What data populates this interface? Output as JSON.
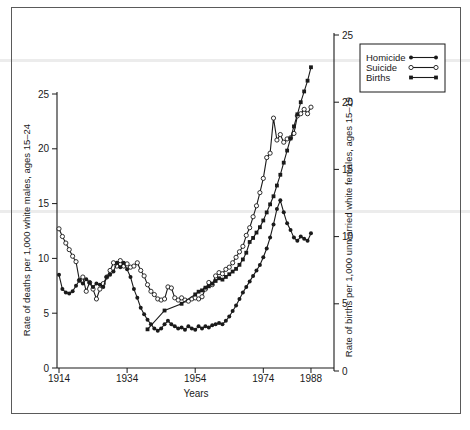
{
  "figure": {
    "background": "#ffffff",
    "frame_color": "#5a5a5a",
    "ink_color": "#1a1a1a",
    "artifact_band_color": "#ececec"
  },
  "chart_data": {
    "type": "line",
    "title": "",
    "xlabel": "Years",
    "ylabel_left": "Rate of deaths per 1,000 white males, ages 15–24",
    "ylabel_right": "Rate of births per 1,000 unmarried white females, ages 15–19",
    "x_ticks": [
      1914,
      1934,
      1954,
      1974,
      1988
    ],
    "x_range": [
      1914,
      1995
    ],
    "y_left_ticks": [
      0,
      5,
      10,
      15,
      20,
      25
    ],
    "y_left_range": [
      0,
      25
    ],
    "y_right_ticks": [
      0,
      5,
      10,
      15,
      20,
      25
    ],
    "y_right_range": [
      0,
      25
    ],
    "grid": false,
    "legend_position": "top-right",
    "series": [
      {
        "name": "Homicide",
        "axis": "left",
        "marker": "filled-circle",
        "color": "#1a1a1a",
        "x": [
          1914,
          1915,
          1916,
          1917,
          1918,
          1919,
          1920,
          1921,
          1922,
          1923,
          1924,
          1925,
          1926,
          1927,
          1928,
          1929,
          1930,
          1931,
          1932,
          1933,
          1934,
          1935,
          1936,
          1937,
          1938,
          1939,
          1940,
          1941,
          1942,
          1943,
          1944,
          1945,
          1946,
          1947,
          1948,
          1949,
          1950,
          1951,
          1952,
          1953,
          1954,
          1955,
          1956,
          1957,
          1958,
          1959,
          1960,
          1961,
          1962,
          1963,
          1964,
          1965,
          1966,
          1967,
          1968,
          1969,
          1970,
          1971,
          1972,
          1973,
          1974,
          1975,
          1976,
          1977,
          1978,
          1979,
          1980,
          1981,
          1982,
          1983,
          1984,
          1985,
          1986,
          1987,
          1988
        ],
        "y": [
          8.5,
          7.2,
          6.9,
          6.8,
          7.0,
          7.5,
          8.0,
          7.7,
          8.1,
          7.8,
          7.4,
          7.7,
          7.6,
          7.4,
          8.3,
          8.5,
          8.8,
          9.6,
          9.2,
          9.6,
          9.0,
          8.3,
          7.2,
          6.4,
          5.5,
          4.9,
          4.4,
          4.0,
          3.6,
          3.4,
          3.6,
          4.0,
          4.3,
          4.0,
          3.8,
          3.6,
          3.7,
          3.5,
          3.8,
          3.6,
          3.5,
          3.8,
          3.6,
          3.8,
          3.7,
          3.9,
          4.0,
          4.1,
          4.0,
          4.3,
          4.7,
          5.2,
          5.7,
          6.3,
          6.9,
          7.4,
          7.9,
          8.4,
          8.9,
          9.4,
          10.1,
          10.9,
          11.9,
          13.1,
          14.5,
          15.3,
          14.2,
          13.2,
          12.6,
          11.9,
          11.6,
          12.0,
          11.8,
          11.6,
          12.3
        ]
      },
      {
        "name": "Suicide",
        "axis": "left",
        "marker": "open-circle",
        "color": "#1a1a1a",
        "x": [
          1914,
          1915,
          1916,
          1917,
          1918,
          1919,
          1920,
          1921,
          1922,
          1923,
          1924,
          1925,
          1926,
          1927,
          1928,
          1929,
          1930,
          1931,
          1932,
          1933,
          1934,
          1935,
          1936,
          1937,
          1938,
          1939,
          1940,
          1941,
          1942,
          1943,
          1944,
          1945,
          1946,
          1947,
          1948,
          1949,
          1950,
          1951,
          1952,
          1953,
          1954,
          1955,
          1956,
          1957,
          1958,
          1959,
          1960,
          1961,
          1962,
          1963,
          1964,
          1965,
          1966,
          1967,
          1968,
          1969,
          1970,
          1971,
          1972,
          1973,
          1974,
          1975,
          1976,
          1977,
          1978,
          1979,
          1980,
          1981,
          1982,
          1983,
          1984,
          1985,
          1986,
          1987,
          1988
        ],
        "y": [
          12.7,
          12.0,
          11.4,
          10.8,
          10.2,
          9.7,
          8.0,
          8.3,
          7.0,
          7.8,
          7.2,
          6.3,
          7.2,
          7.7,
          8.3,
          8.9,
          9.6,
          9.3,
          9.8,
          9.3,
          9.5,
          9.2,
          9.3,
          9.6,
          8.9,
          8.4,
          7.6,
          7.0,
          6.7,
          6.3,
          6.2,
          6.3,
          7.4,
          7.3,
          6.4,
          6.2,
          6.4,
          6.2,
          6.1,
          6.3,
          6.4,
          6.3,
          6.5,
          7.2,
          7.8,
          7.6,
          8.4,
          8.7,
          8.6,
          9.0,
          9.2,
          9.6,
          10.1,
          10.6,
          11.1,
          12.1,
          12.8,
          13.8,
          14.8,
          16.0,
          17.3,
          19.2,
          19.6,
          22.8,
          20.8,
          21.3,
          20.6,
          20.9,
          21.0,
          21.4,
          23.0,
          23.2,
          23.6,
          23.2,
          23.8
        ]
      },
      {
        "name": "Births",
        "axis": "right",
        "marker": "filled-square",
        "color": "#1a1a1a",
        "x": [
          1940,
          1945,
          1950,
          1954,
          1955,
          1956,
          1957,
          1958,
          1959,
          1960,
          1961,
          1962,
          1963,
          1964,
          1965,
          1966,
          1967,
          1968,
          1969,
          1970,
          1971,
          1972,
          1973,
          1974,
          1975,
          1976,
          1977,
          1978,
          1979,
          1980,
          1981,
          1982,
          1983,
          1984,
          1985,
          1986,
          1987,
          1988
        ],
        "y": [
          3.1,
          4.5,
          5.0,
          5.7,
          5.9,
          6.0,
          6.2,
          6.3,
          6.5,
          6.7,
          6.9,
          6.8,
          7.0,
          7.2,
          7.4,
          7.6,
          7.9,
          8.3,
          8.8,
          9.6,
          9.9,
          10.3,
          10.7,
          11.2,
          11.8,
          12.4,
          13.0,
          13.8,
          14.6,
          15.5,
          16.4,
          17.3,
          18.2,
          19.1,
          20.0,
          20.8,
          21.6,
          22.6
        ]
      }
    ]
  }
}
